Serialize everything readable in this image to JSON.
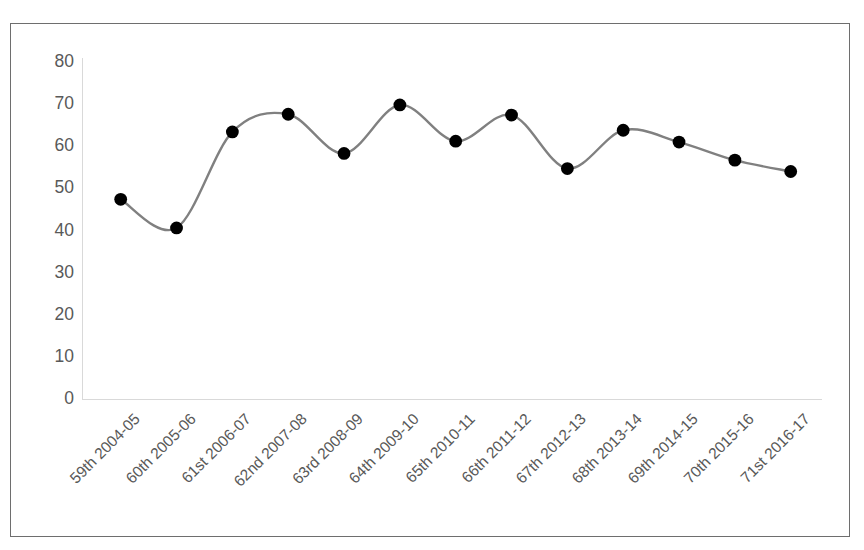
{
  "chart_data": {
    "type": "line",
    "title": "",
    "subtitle": "",
    "xlabel": "",
    "ylabel": "",
    "ylim": [
      0,
      80
    ],
    "yticks": [
      0,
      10,
      20,
      30,
      40,
      50,
      60,
      70,
      80
    ],
    "grid": false,
    "legend": "none",
    "marker": "circle",
    "marker_color": "#000000",
    "line_color": "#808080",
    "categories": [
      "59th 2004-05",
      "60th 2005-06",
      "61st 2006-07",
      "62nd 2007-08",
      "63rd 2008-09",
      "64th 2009-10",
      "65th 2010-11",
      "66th 2011-12",
      "67th 2012-13",
      "68th 2013-14",
      "69th 2014-15",
      "70th 2015-16",
      "71st 2016-17"
    ],
    "values": [
      47.4,
      40.6,
      63.4,
      67.6,
      58.3,
      69.8,
      61.2,
      67.4,
      54.7,
      63.8,
      61.0,
      56.7,
      54.0
    ],
    "series": [
      {
        "name": "series-1",
        "values": [
          47.4,
          40.6,
          63.4,
          67.6,
          58.3,
          69.8,
          61.2,
          67.4,
          54.7,
          63.8,
          61.0,
          56.7,
          54.0
        ]
      }
    ]
  },
  "colors": {
    "line": "#808080",
    "marker": "#000000",
    "axis": "#d9d9d9",
    "tick_text": "#595959",
    "frame_border": "#6e6e6e",
    "background": "#ffffff"
  }
}
